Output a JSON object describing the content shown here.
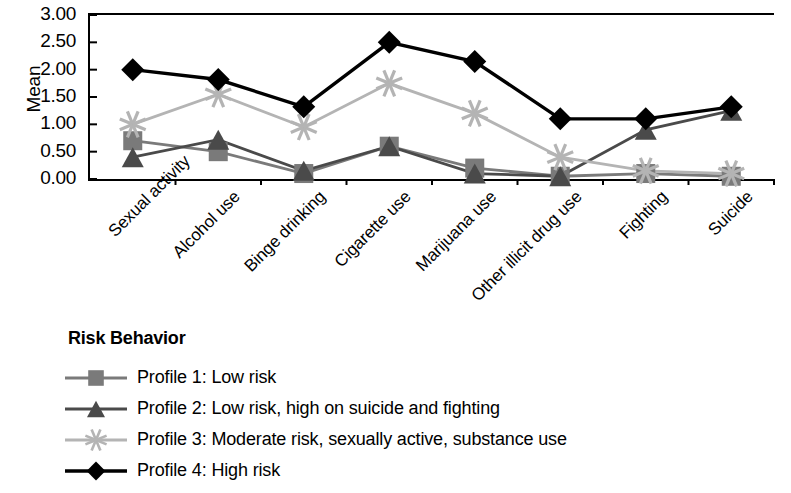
{
  "chart_data": {
    "type": "line",
    "title": "",
    "xlabel": "",
    "ylabel": "Mean",
    "ylim": [
      0,
      3
    ],
    "ytick_labels": [
      "3.00",
      "2.50",
      "2.00",
      "1.50",
      "1.00",
      "0.50",
      "0.00"
    ],
    "ytick_values": [
      3.0,
      2.5,
      2.0,
      1.5,
      1.0,
      0.5,
      0.0
    ],
    "grid": false,
    "legend_position": "below-plot-left",
    "legend_title": "Risk Behavior",
    "categories": [
      "Sexual activity",
      "Alcohol use",
      "Binge drinking",
      "Cigarette use",
      "Marijuana use",
      "Other illicit drug use",
      "Fighting",
      "Suicide"
    ],
    "series": [
      {
        "name": "Profile 1: Low risk",
        "marker": "square",
        "color": "#7a7a7a",
        "values": [
          0.7,
          0.5,
          0.1,
          0.6,
          0.2,
          0.05,
          0.1,
          0.05
        ]
      },
      {
        "name": "Profile 2: Low risk, high on suicide and fighting",
        "marker": "triangle",
        "color": "#4a4a4a",
        "values": [
          0.4,
          0.72,
          0.15,
          0.6,
          0.1,
          0.05,
          0.9,
          1.25
        ]
      },
      {
        "name": "Profile 3: Moderate risk, sexually active, substance use",
        "marker": "star",
        "color": "#b4b4b4",
        "values": [
          1.0,
          1.55,
          0.95,
          1.75,
          1.2,
          0.4,
          0.15,
          0.1
        ]
      },
      {
        "name": "Profile 4: High risk",
        "marker": "diamond",
        "color": "#000000",
        "values": [
          2.0,
          1.82,
          1.32,
          2.5,
          2.15,
          1.1,
          1.1,
          1.32
        ]
      }
    ]
  },
  "axis": {
    "y_title": "Mean"
  }
}
